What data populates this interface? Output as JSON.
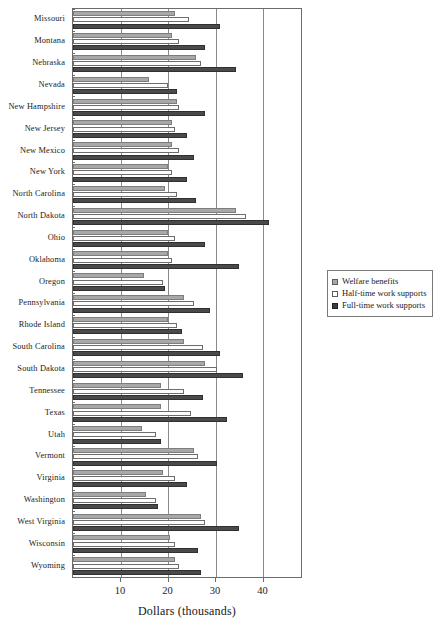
{
  "chart_data": {
    "type": "bar",
    "orientation": "horizontal",
    "title": "",
    "xlabel": "Dollars (thousands)",
    "ylabel": "",
    "xlim": [
      0,
      48.4
    ],
    "xticks": [
      10,
      20,
      30,
      40
    ],
    "xticklabels": [
      "10",
      "20",
      "30",
      "40"
    ],
    "grid": true,
    "grid_axis": "x",
    "legend_position": "right",
    "categories": [
      "Missouri",
      "Montana",
      "Nebraska",
      "Nevada",
      "New Hampshire",
      "New Jersey",
      "New Mexico",
      "New York",
      "North Carolina",
      "North Dakota",
      "Ohio",
      "Oklahoma",
      "Oregon",
      "Pennsylvania",
      "Rhode Island",
      "South Carolina",
      "South Dakota",
      "Tennessee",
      "Texas",
      "Utah",
      "Vermont",
      "Virginia",
      "Washington",
      "West Virginia",
      "Wisconsin",
      "Wyoming"
    ],
    "series": [
      {
        "name": "Welfare benefits",
        "color": "#a8a8a8",
        "values": [
          21.5,
          21.0,
          26.0,
          16.0,
          22.0,
          21.0,
          21.0,
          20.0,
          19.5,
          34.5,
          20.0,
          20.0,
          15.0,
          23.5,
          20.0,
          23.5,
          28.0,
          18.5,
          18.5,
          14.5,
          25.5,
          19.0,
          15.5,
          27.0,
          20.5,
          21.5
        ]
      },
      {
        "name": "Half-time work supports",
        "color": "#ffffff",
        "values": [
          24.5,
          22.5,
          27.0,
          20.0,
          22.5,
          21.5,
          22.5,
          21.0,
          22.0,
          36.5,
          21.5,
          21.0,
          19.0,
          25.5,
          22.0,
          27.5,
          30.5,
          23.5,
          25.0,
          17.5,
          26.5,
          21.5,
          17.5,
          28.0,
          21.5,
          22.5
        ]
      },
      {
        "name": "Full-time work supports",
        "color": "#4a4a4a",
        "values": [
          31.0,
          28.0,
          34.5,
          22.0,
          28.0,
          24.0,
          25.5,
          24.0,
          26.0,
          41.5,
          28.0,
          35.0,
          19.5,
          29.0,
          23.0,
          31.0,
          36.0,
          27.5,
          32.5,
          18.5,
          30.5,
          24.0,
          18.0,
          35.0,
          26.5,
          27.0
        ]
      }
    ]
  },
  "legend": {
    "items": [
      {
        "label": "Welfare benefits"
      },
      {
        "label": "Half-time work supports"
      },
      {
        "label": "Full-time work supports"
      }
    ]
  },
  "axis": {
    "x_title": "Dollars (thousands)"
  }
}
